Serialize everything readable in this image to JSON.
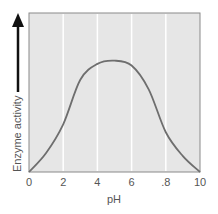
{
  "chart_data": {
    "type": "line",
    "title": "",
    "xlabel": "pH",
    "ylabel": "Enzyme activity",
    "xlim": [
      0,
      10
    ],
    "ylim": [
      0,
      100
    ],
    "x_ticks": [
      "0",
      "2",
      "4",
      "6",
      ".8",
      "10"
    ],
    "x_tick_values": [
      0,
      2,
      4,
      6,
      8,
      10
    ],
    "grid": {
      "vertical": true,
      "horizontal": false
    },
    "series": [
      {
        "name": "Enzyme activity",
        "x": [
          0,
          1,
          2,
          3,
          4,
          5,
          6,
          7,
          8,
          9,
          10
        ],
        "values": [
          0,
          12,
          30,
          58,
          68,
          70,
          67,
          52,
          25,
          10,
          0
        ]
      }
    ],
    "colors": {
      "plot_background": "#e6e6e6",
      "grid": "#ffffff",
      "curve": "#6e6e6e",
      "border": "#8a8a8a",
      "arrow": "#111111"
    }
  }
}
